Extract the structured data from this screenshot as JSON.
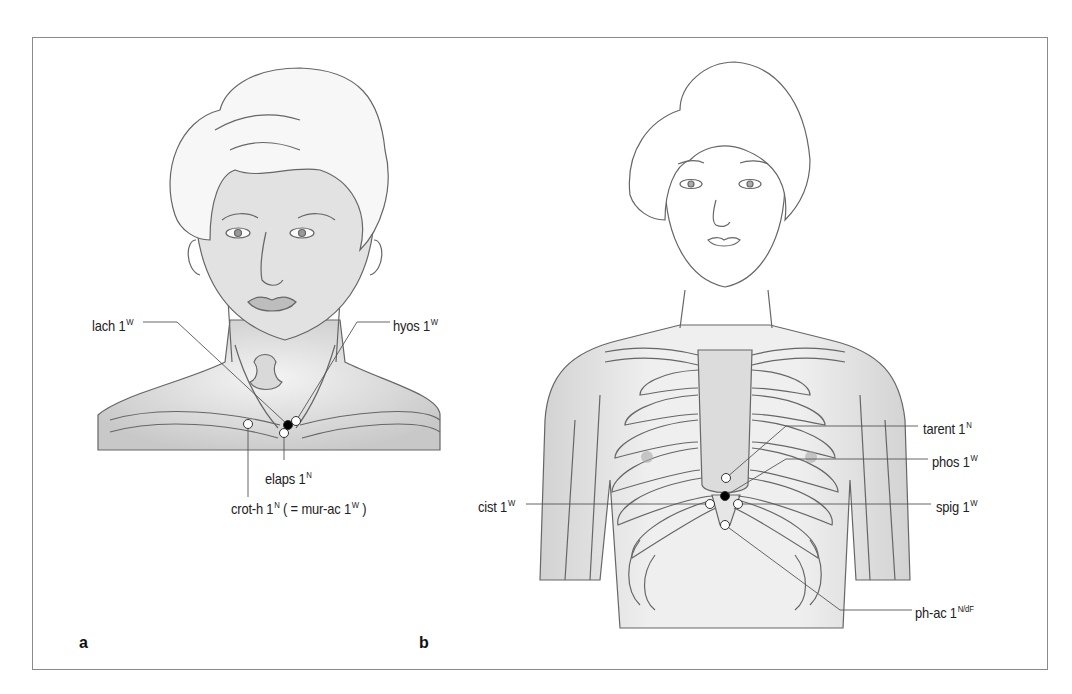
{
  "figure": {
    "panels": [
      {
        "id": "a",
        "letter": "a",
        "description": "Head and neck with points near the jugular notch and clavicle",
        "labels": [
          {
            "name": "lach",
            "text": "lach 1",
            "sup": "W"
          },
          {
            "name": "hyos",
            "text": "hyos 1",
            "sup": "W"
          },
          {
            "name": "elaps",
            "text": "elaps 1",
            "sup": "N"
          },
          {
            "name": "crot-h",
            "text": "crot-h 1",
            "sup": "N",
            "suffix_pre": " ( = mur-ac 1",
            "suffix_sup": "W",
            "suffix_post": " )"
          }
        ]
      },
      {
        "id": "b",
        "letter": "b",
        "description": "Upper torso with rib cage and points around the xiphoid process",
        "labels": [
          {
            "name": "tarent",
            "text": "tarent 1",
            "sup": "N"
          },
          {
            "name": "phos",
            "text": "phos 1",
            "sup": "W"
          },
          {
            "name": "cist",
            "text": "cist 1",
            "sup": "W"
          },
          {
            "name": "spig",
            "text": "spig 1",
            "sup": "W"
          },
          {
            "name": "ph-ac",
            "text": "ph-ac 1",
            "sup": "N/dF"
          }
        ]
      }
    ],
    "colors": {
      "frame": "#8a8a8a",
      "line": "#555555",
      "skin": "#e4e4e4",
      "shadow": "#bdbdbd",
      "point_open": "#ffffff",
      "point_filled": "#000000"
    }
  }
}
